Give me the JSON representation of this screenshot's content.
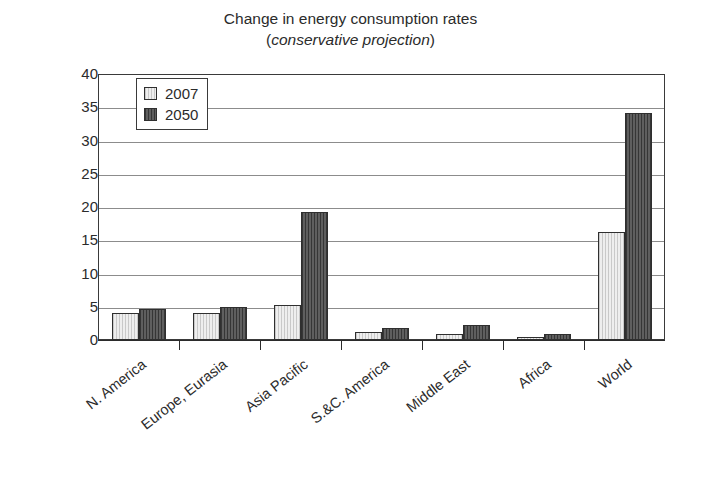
{
  "chart_data": {
    "type": "bar",
    "title": "Change in energy consumption rates",
    "subtitle": "(conservative projection)",
    "subtitle_paren_open": "(",
    "subtitle_italic": "conservative projection",
    "subtitle_paren_close": ")",
    "xlabel": "",
    "ylabel": "Terawats",
    "ylim": [
      0,
      40
    ],
    "ytick_step": 5,
    "yticks": [
      40,
      35,
      30,
      25,
      20,
      15,
      10,
      5,
      0
    ],
    "ytick_labels": [
      "40",
      "35",
      "30",
      "25",
      "20",
      "15",
      "10",
      "5",
      "0"
    ],
    "grid": true,
    "legend_position": "top-left-inside",
    "categories": [
      "N. America",
      "Europe, Eurasia",
      "Asia Pacific",
      "S.&C. America",
      "Middle East",
      "Africa",
      "World"
    ],
    "series": [
      {
        "name": "2007",
        "color": "#eeeeee",
        "values": [
          4.1,
          4.1,
          5.2,
          1.2,
          0.9,
          0.5,
          16.3
        ]
      },
      {
        "name": "2050",
        "color": "#4d4d4d",
        "values": [
          4.6,
          5.0,
          19.3,
          1.8,
          2.3,
          0.9,
          34.1
        ]
      }
    ]
  },
  "legend": {
    "entries": [
      {
        "label": "2007"
      },
      {
        "label": "2050"
      }
    ]
  }
}
